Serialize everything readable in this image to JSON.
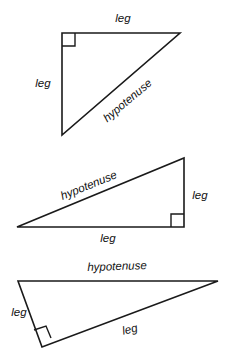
{
  "figure": {
    "background_color": "#ffffff",
    "stroke_color": "#1a1a1a",
    "text_color": "#111111",
    "label_style": "italic"
  },
  "triangles": [
    {
      "id": "triangle-1",
      "right_angle_at": "top-left",
      "vertices": {
        "a": {
          "x": 62,
          "y": 33
        },
        "b": {
          "x": 180,
          "y": 33
        },
        "c": {
          "x": 62,
          "y": 135
        }
      },
      "labels": {
        "top": {
          "text": "leg",
          "x": 123,
          "y": 19,
          "rotation": 0
        },
        "left": {
          "text": "leg",
          "x": 43,
          "y": 84,
          "rotation": 0
        },
        "hypotenuse": {
          "text": "hypotenuse",
          "x": 128,
          "y": 101,
          "rotation": -40
        }
      }
    },
    {
      "id": "triangle-2",
      "right_angle_at": "bottom-right",
      "vertices": {
        "a": {
          "x": 17,
          "y": 227
        },
        "b": {
          "x": 184,
          "y": 158
        },
        "c": {
          "x": 184,
          "y": 227
        }
      },
      "labels": {
        "hypotenuse": {
          "text": "hypotenuse",
          "x": 89,
          "y": 186,
          "rotation": -22
        },
        "right": {
          "text": "leg",
          "x": 200,
          "y": 196,
          "rotation": 0
        },
        "bottom": {
          "text": "leg",
          "x": 108,
          "y": 239,
          "rotation": 0
        }
      }
    },
    {
      "id": "triangle-3",
      "right_angle_at": "bottom-left",
      "vertices": {
        "a": {
          "x": 18,
          "y": 281
        },
        "b": {
          "x": 218,
          "y": 281
        },
        "c": {
          "x": 42,
          "y": 347
        }
      },
      "labels": {
        "hypotenuse": {
          "text": "hypotenuse",
          "x": 117,
          "y": 267,
          "rotation": -2
        },
        "left": {
          "text": "leg",
          "x": 19,
          "y": 313,
          "rotation": 0
        },
        "diagonal": {
          "text": "leg",
          "x": 130,
          "y": 330,
          "rotation": -14
        }
      }
    }
  ]
}
